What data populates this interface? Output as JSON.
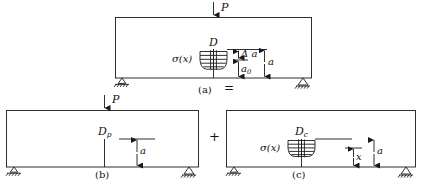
{
  "figure": {
    "type": "engineering-diagram",
    "equation_symbols": {
      "equals": "=",
      "plus": "+"
    }
  },
  "panels": [
    {
      "id": "a",
      "caption": "(a)",
      "load_label": "P",
      "crack_label": "D",
      "stress_label": "σ(x)",
      "dimensions": [
        {
          "name": "delta-a",
          "label": "Δ a"
        },
        {
          "name": "a0",
          "label": "a",
          "subscript": "0"
        },
        {
          "name": "a-total",
          "label": "a"
        }
      ],
      "supports": [
        "roller-left",
        "pin-right"
      ]
    },
    {
      "id": "b",
      "caption": "(b)",
      "load_label": "P",
      "crack_label": "D",
      "crack_subscript": "p",
      "dimensions": [
        {
          "name": "a-total",
          "label": "a"
        }
      ],
      "supports": [
        "roller-left",
        "pin-right"
      ]
    },
    {
      "id": "c",
      "caption": "(c)",
      "crack_label": "D",
      "crack_subscript": "c",
      "stress_label": "σ(x)",
      "dimensions": [
        {
          "name": "x-depth",
          "label": "x"
        },
        {
          "name": "a-total",
          "label": "a"
        }
      ],
      "supports": [
        "roller-left",
        "pin-right"
      ]
    }
  ],
  "colors": {
    "line": "#1a1a1a",
    "background": "#ffffff"
  }
}
